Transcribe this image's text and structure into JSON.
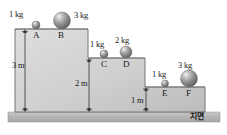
{
  "diagram": {
    "ground_label": "지면",
    "steps": [
      {
        "id": "step-1",
        "height_label": "3 m",
        "x1": 15,
        "x2": 88,
        "top": 29
      },
      {
        "id": "step-2",
        "height_label": "2 m",
        "x1": 88,
        "x2": 145,
        "top": 58
      },
      {
        "id": "step-3",
        "height_label": "1 m",
        "x1": 145,
        "x2": 205,
        "top": 87
      }
    ],
    "masses": [
      {
        "point": "A",
        "mass_label": "1 kg",
        "step": 1,
        "cx": 36,
        "r": 4.0
      },
      {
        "point": "B",
        "mass_label": "3 kg",
        "step": 1,
        "cx": 62,
        "r": 8.5
      },
      {
        "point": "C",
        "mass_label": "1 kg",
        "step": 2,
        "cx": 104,
        "r": 4.0
      },
      {
        "point": "D",
        "mass_label": "2 kg",
        "step": 2,
        "cx": 126,
        "r": 6.0
      },
      {
        "point": "E",
        "mass_label": "1 kg",
        "step": 3,
        "cx": 165,
        "r": 3.5
      },
      {
        "point": "F",
        "mass_label": "3 kg",
        "step": 3,
        "cx": 189,
        "r": 8.5
      }
    ],
    "colors": {
      "step_fill_light": "#d8d8d8",
      "step_fill_dark": "#b8b8b8",
      "outline": "#5a5a5a",
      "ground": "#b4b4b4",
      "sphere_dark": "#6e6e6e",
      "sphere_light": "#e8e8e8",
      "text": "#1a1a1a"
    }
  }
}
